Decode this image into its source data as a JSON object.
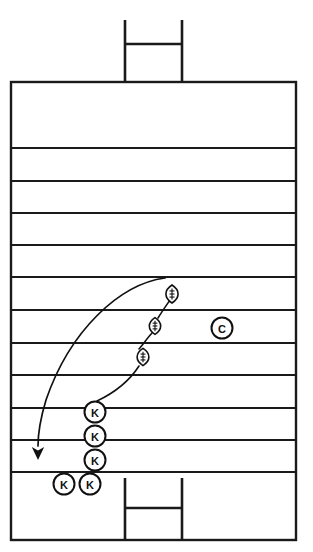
{
  "diagram": {
    "type": "american-football-play-diagram",
    "orientation": "vertical",
    "colors": {
      "field_background": "#ffffff",
      "line": "#1a1a1a",
      "marker_stroke": "#111111",
      "marker_fill": "#ffffff",
      "route": "#111111"
    },
    "field": {
      "left": 11,
      "right": 296,
      "top": 82,
      "bottom": 540,
      "border_width": 2.4,
      "yard_line_width": 2.0,
      "yard_lines_y": [
        148,
        181,
        213,
        245,
        277,
        310,
        343,
        375,
        408,
        440,
        472
      ],
      "yard_line_count": 11
    },
    "goalposts": [
      {
        "name": "top-goalpost",
        "crossbar_y": 44,
        "upright_top_y": 20,
        "base_y": 82,
        "left_x": 125,
        "right_x": 182
      },
      {
        "name": "bottom-goalpost",
        "crossbar_y": 508,
        "upright_top_y": 478,
        "base_y": 540,
        "left_x": 125,
        "right_x": 182
      }
    ],
    "markers": [
      {
        "name": "kicker-marker-1",
        "label": "K",
        "shape": "circle",
        "x": 95,
        "y": 412,
        "r": 10.5
      },
      {
        "name": "kicker-marker-2",
        "label": "K",
        "shape": "circle",
        "x": 95,
        "y": 436,
        "r": 10.5
      },
      {
        "name": "kicker-marker-3",
        "label": "K",
        "shape": "circle",
        "x": 95,
        "y": 460,
        "r": 10.5
      },
      {
        "name": "kicker-marker-4",
        "label": "K",
        "shape": "circle",
        "x": 64,
        "y": 484,
        "r": 10.5
      },
      {
        "name": "kicker-marker-5",
        "label": "K",
        "shape": "circle",
        "x": 90,
        "y": 484,
        "r": 10.5
      },
      {
        "name": "center-marker",
        "label": "C",
        "shape": "circle",
        "x": 222,
        "y": 328,
        "r": 10.5
      }
    ],
    "balls": [
      {
        "name": "football-marker-1",
        "label": "football",
        "x": 172,
        "y": 294,
        "rx": 6.0,
        "ry": 9.0
      },
      {
        "name": "football-marker-2",
        "label": "football",
        "x": 155,
        "y": 326,
        "rx": 5.6,
        "ry": 8.4
      },
      {
        "name": "football-marker-3",
        "label": "football",
        "x": 143,
        "y": 357,
        "rx": 5.8,
        "ry": 8.6
      }
    ],
    "routes": [
      {
        "name": "kick-return-arc",
        "label": "ball flight path",
        "style": "solid-curve-with-arrowhead",
        "path": "M 165 278 C 120 284, 70 330, 46 400 C 40 420, 38 436, 38 446",
        "arrow": {
          "x": 38,
          "y": 460,
          "direction": "down"
        }
      },
      {
        "name": "ball-chain-link-lower",
        "label": "ball progression lower",
        "style": "solid-curve",
        "path": "M 97 401 C 116 392, 130 380, 139 366"
      },
      {
        "name": "ball-chain-link-middle",
        "label": "ball progression middle",
        "style": "solid-curve",
        "path": "M 139 349 C 144 343, 149 336, 152 333"
      },
      {
        "name": "ball-chain-link-upper",
        "label": "ball progression upper",
        "style": "solid-curve",
        "path": "M 158 318 C 163 310, 168 303, 170 300"
      }
    ]
  }
}
